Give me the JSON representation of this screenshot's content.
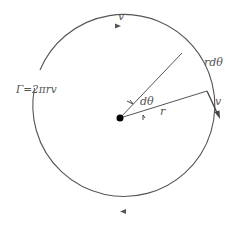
{
  "diagram": {
    "type": "vortex-circulation",
    "labels": {
      "velocity_top": "v",
      "velocity_right": "v",
      "arc_length": "rdθ",
      "angle": "dθ",
      "radius": "r",
      "circulation": "Γ=2πrv"
    },
    "colors": {
      "stroke": "#555555",
      "center_dot": "#000000",
      "background": "#ffffff"
    }
  }
}
